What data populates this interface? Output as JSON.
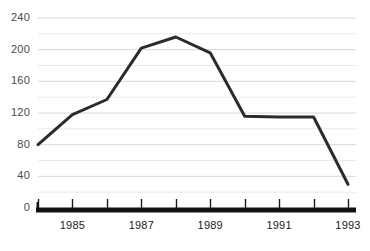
{
  "chart_data": {
    "type": "line",
    "title": "",
    "xlabel": "",
    "ylabel": "",
    "x": [
      1984,
      1985,
      1986,
      1987,
      1988,
      1989,
      1990,
      1991,
      1992,
      1993
    ],
    "values": [
      80,
      118,
      137,
      202,
      216,
      196,
      116,
      115,
      115,
      30
    ],
    "series": [
      {
        "name": "series-1",
        "values": [
          80,
          118,
          137,
          202,
          216,
          196,
          116,
          115,
          115,
          30
        ]
      }
    ],
    "ylim": [
      0,
      240
    ],
    "xlim": [
      1984,
      1993
    ],
    "y_major_ticks": [
      0,
      40,
      80,
      120,
      160,
      200,
      240
    ],
    "y_minor_ticks": [
      20,
      60,
      100,
      140,
      180,
      220
    ],
    "y_tick_labels": [
      "0",
      "40",
      "80",
      "120",
      "160",
      "200",
      "240"
    ],
    "x_tick_values": [
      1984,
      1985,
      1986,
      1987,
      1988,
      1989,
      1990,
      1991,
      1992,
      1993
    ],
    "x_tick_labels": [
      "",
      "1985",
      "",
      "1987",
      "",
      "1989",
      "",
      "1991",
      "",
      "1993"
    ],
    "x_visible_labels": [
      "1985",
      "1987",
      "1989",
      "1991",
      "1993"
    ],
    "grid": true,
    "grid_axis": "y",
    "legend": false,
    "legend_position": "none",
    "annotations": [],
    "colors": {
      "line": "#2b2b2b",
      "grid_major": "#d8d8d8",
      "grid_minor": "#e9e9e9",
      "axis_baseline": "#111111",
      "tick_mark": "#1a1a1a",
      "y_label_text": "#4a4a4a",
      "x_label_text": "#1a1a1a",
      "background": "#ffffff"
    },
    "line_width_px": 3,
    "baseline_width_px": 5
  },
  "axes": {
    "y_labels": [
      "240",
      "200",
      "160",
      "120",
      "80",
      "40",
      "0"
    ],
    "x_labels": [
      "1985",
      "1987",
      "1989",
      "1991",
      "1993"
    ]
  }
}
